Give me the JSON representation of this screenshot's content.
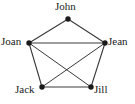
{
  "figure": {
    "kind": "undirected-graph-diagram",
    "background_color": "#ffffff",
    "edge_color": "#3a3a3a",
    "node_color": "#1a1a1a",
    "label_color": "#1a1a1a"
  },
  "nodes": [
    {
      "id": "john",
      "label": "John",
      "x": 68,
      "y": 19,
      "label_position": "above"
    },
    {
      "id": "joan",
      "label": "Joan",
      "x": 29,
      "y": 43,
      "label_position": "left"
    },
    {
      "id": "jean",
      "label": "Jean",
      "x": 105,
      "y": 43,
      "label_position": "right"
    },
    {
      "id": "jack",
      "label": "Jack",
      "x": 42,
      "y": 87,
      "label_position": "left"
    },
    {
      "id": "jill",
      "label": "Jill",
      "x": 91,
      "y": 87,
      "label_position": "right"
    }
  ],
  "edges": [
    {
      "from": "john",
      "to": "joan",
      "kind": "pentagon-side"
    },
    {
      "from": "john",
      "to": "jean",
      "kind": "pentagon-side"
    },
    {
      "from": "joan",
      "to": "jack",
      "kind": "pentagon-side"
    },
    {
      "from": "jean",
      "to": "jill",
      "kind": "pentagon-side"
    },
    {
      "from": "jack",
      "to": "jill",
      "kind": "pentagon-side"
    },
    {
      "from": "joan",
      "to": "jean",
      "kind": "chord"
    },
    {
      "from": "joan",
      "to": "jill",
      "kind": "diagonal"
    },
    {
      "from": "jean",
      "to": "jack",
      "kind": "diagonal"
    }
  ]
}
